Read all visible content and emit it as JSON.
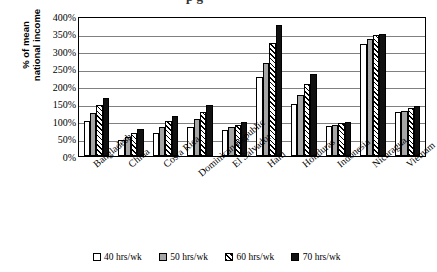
{
  "chart_data": {
    "type": "bar",
    "title": "",
    "xlabel": "",
    "ylabel": "% of mean national income",
    "ylim": [
      0,
      400
    ],
    "ytick_values": [
      0,
      50,
      100,
      150,
      200,
      250,
      300,
      350,
      400
    ],
    "ytick_labels": [
      "0%",
      "50%",
      "100%",
      "150%",
      "200%",
      "250%",
      "300%",
      "350%",
      "400%"
    ],
    "grid": true,
    "legend_position": "bottom",
    "categories": [
      "Bangladesh",
      "China",
      "Costa Rica",
      "Dominican Republic",
      "El Salvador",
      "Haiti",
      "Honduras",
      "Indonesia",
      "Nicaragua",
      "Vietnam"
    ],
    "series": [
      {
        "name": "40 hrs/wk",
        "fill": "white",
        "color": "#ffffff",
        "values": [
          100,
          45,
          65,
          82,
          73,
          225,
          150,
          85,
          320,
          125
        ]
      },
      {
        "name": "50 hrs/wk",
        "fill": "gray",
        "color": "#a6a6a6",
        "values": [
          122,
          55,
          83,
          105,
          82,
          267,
          175,
          88,
          335,
          130
        ]
      },
      {
        "name": "60 hrs/wk",
        "fill": "hatched",
        "color": "#ffffff",
        "values": [
          145,
          65,
          100,
          125,
          90,
          322,
          205,
          95,
          345,
          138
        ]
      },
      {
        "name": "70 hrs/wk",
        "fill": "black",
        "color": "#111111",
        "values": [
          165,
          78,
          115,
          145,
          98,
          375,
          235,
          98,
          350,
          142
        ]
      }
    ]
  },
  "axis": {
    "y_title_line1": "% of mean",
    "y_title_line2": "national income"
  },
  "legend": {
    "items": [
      {
        "label": "40 hrs/wk",
        "style": "white"
      },
      {
        "label": "50 hrs/wk",
        "style": "gray"
      },
      {
        "label": "60 hrs/wk",
        "style": "hatched"
      },
      {
        "label": "70 hrs/wk",
        "style": "black"
      }
    ]
  },
  "cropped_title": "p g"
}
